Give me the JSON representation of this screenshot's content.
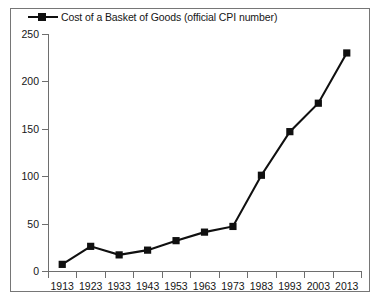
{
  "chart_data": {
    "type": "line",
    "title": "",
    "xlabel": "",
    "ylabel": "",
    "legend_position": "top-left",
    "grid": false,
    "ylim": [
      0,
      250
    ],
    "yticks": [
      0,
      50,
      100,
      150,
      200,
      250
    ],
    "categories": [
      "1913",
      "1923",
      "1933",
      "1943",
      "1953",
      "1963",
      "1973",
      "1983",
      "1993",
      "2003",
      "2013"
    ],
    "series": [
      {
        "name": "Cost of a Basket of Goods (official CPI number)",
        "marker": "square",
        "color": "#101010",
        "values": [
          7,
          26,
          17,
          22,
          32,
          41,
          47,
          101,
          147,
          177,
          230
        ]
      }
    ]
  },
  "legend": {
    "entries": [
      {
        "label": "Cost of a Basket of Goods (official CPI number)",
        "marker_icon": "square-marker-icon"
      }
    ]
  },
  "axes": {
    "y_tick_labels": [
      "250",
      "200",
      "150",
      "100",
      "50",
      "0"
    ],
    "x_tick_labels": [
      "1913",
      "1923",
      "1933",
      "1943",
      "1953",
      "1963",
      "1973",
      "1983",
      "1993",
      "2003",
      "2013"
    ]
  },
  "colors": {
    "series": "#101010",
    "axis": "#6e6e6e",
    "frame": "#767676",
    "background": "#ffffff",
    "text": "#161616"
  }
}
